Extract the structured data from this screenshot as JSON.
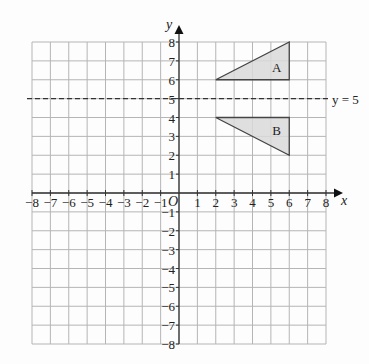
{
  "chart_data": {
    "type": "coordinate-grid",
    "title": "",
    "xlabel": "x",
    "ylabel": "y",
    "origin_label": "O",
    "xlim": [
      -8,
      8
    ],
    "ylim": [
      -8,
      8
    ],
    "grid": true,
    "x_ticks": [
      -8,
      -7,
      -6,
      -5,
      -4,
      -3,
      -2,
      -1,
      1,
      2,
      3,
      4,
      5,
      6,
      7,
      8
    ],
    "y_ticks": [
      -8,
      -7,
      -6,
      -5,
      -4,
      -3,
      -2,
      -1,
      1,
      2,
      3,
      4,
      5,
      6,
      7,
      8
    ],
    "lines": [
      {
        "equation": "y = 5",
        "style": "dashed",
        "label": "y = 5"
      }
    ],
    "shapes": [
      {
        "name": "A",
        "type": "triangle",
        "vertices": [
          [
            2,
            6
          ],
          [
            6,
            8
          ],
          [
            6,
            6
          ]
        ],
        "fill": "#d9d9d9"
      },
      {
        "name": "B",
        "type": "triangle",
        "vertices": [
          [
            2,
            4
          ],
          [
            6,
            4
          ],
          [
            6,
            2
          ]
        ],
        "fill": "#d9d9d9"
      }
    ]
  },
  "colors": {
    "grid": "#b5b5b5",
    "axis": "#333333",
    "shape_fill": "#d9d9d9",
    "shape_stroke": "#444444"
  }
}
